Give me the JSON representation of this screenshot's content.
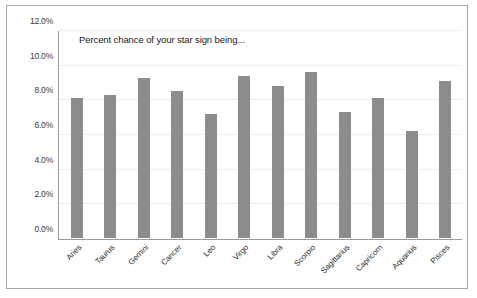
{
  "chart_data": {
    "type": "bar",
    "title": "Percent chance of your star sign being...",
    "xlabel": "",
    "ylabel": "",
    "categories": [
      "Aries",
      "Taurus",
      "Gemini",
      "Cancer",
      "Leo",
      "Virgo",
      "Libra",
      "Scorpio",
      "Sagittarius",
      "Capricorn",
      "Aquarius",
      "Pisces"
    ],
    "values": [
      8.1,
      8.3,
      9.3,
      8.5,
      7.2,
      9.4,
      8.8,
      9.6,
      7.3,
      8.1,
      6.2,
      9.1
    ],
    "ylim": [
      0,
      12
    ],
    "ytick_labels": [
      "0.0%",
      "2.0%",
      "4.0%",
      "6.0%",
      "8.0%",
      "10.0%",
      "12.0%"
    ],
    "ytick_values": [
      0,
      2,
      4,
      6,
      8,
      10,
      12
    ],
    "grid": true,
    "legend": "none",
    "bar_color": "#8c8c8c",
    "gridline_color": "#ededed",
    "axis_color": "#9a9a9a",
    "border_color": "#a8a8a8"
  }
}
